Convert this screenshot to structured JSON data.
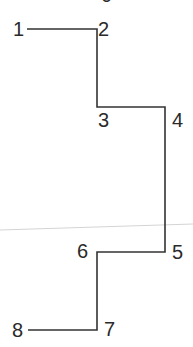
{
  "diagram": {
    "type": "stepped-path",
    "stroke_color": "#333333",
    "guide_color": "#d0d0d0",
    "top_clipped_label": "0",
    "points": [
      {
        "id": "1",
        "label": "1"
      },
      {
        "id": "2",
        "label": "2"
      },
      {
        "id": "3",
        "label": "3"
      },
      {
        "id": "4",
        "label": "4"
      },
      {
        "id": "5",
        "label": "5"
      },
      {
        "id": "6",
        "label": "6"
      },
      {
        "id": "7",
        "label": "7"
      },
      {
        "id": "8",
        "label": "8"
      }
    ]
  }
}
